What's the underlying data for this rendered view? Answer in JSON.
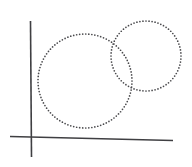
{
  "figure": {
    "title": "",
    "background_color": "#ffffff",
    "width": 192,
    "height": 167
  },
  "axes": {
    "stroke_color": "#3f3f42",
    "stroke_width": 1.6,
    "vertical": {
      "name": "y-axis",
      "x1": 30.5,
      "y1": 21,
      "x2": 31.5,
      "y2": 157
    },
    "horizontal": {
      "name": "x-axis",
      "x1": 10,
      "y1": 136.5,
      "x2": 173,
      "y2": 140.5
    }
  },
  "shapes": [
    {
      "name": "large-circle",
      "type": "circle",
      "style": "dotted",
      "cx": 85,
      "cy": 81,
      "r": 47,
      "dot_color": "#4a4a4d",
      "dot_radius": 0.85,
      "dot_spacing": 3.05
    },
    {
      "name": "small-circle",
      "type": "circle",
      "style": "dotted",
      "cx": 146,
      "cy": 56,
      "r": 35,
      "dot_color": "#4a4a4d",
      "dot_radius": 0.85,
      "dot_spacing": 3.05
    }
  ],
  "chart_data": {
    "type": "scatter",
    "title": "",
    "xlabel": "",
    "ylabel": "",
    "grid": false,
    "legend": null,
    "series": [
      {
        "name": "large-circle",
        "center": [
          85,
          81
        ],
        "radius": 47
      },
      {
        "name": "small-circle",
        "center": [
          146,
          56
        ],
        "radius": 35
      }
    ]
  },
  "labels": {
    "left_region": "",
    "right_region": "",
    "overlap_region": ""
  }
}
